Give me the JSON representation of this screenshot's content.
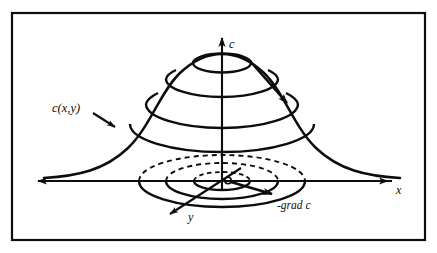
{
  "figure": {
    "title": "",
    "type": "3d-surface-diagram",
    "background_color": "#ffffff",
    "ink_color": "#0d0d0d",
    "frame": {
      "name": "figure-border",
      "x": 12,
      "y": 13,
      "width": 413,
      "height": 227,
      "stroke_width": 2.2
    },
    "axes": [
      {
        "id": "c",
        "label": "c",
        "orientation": "vertical-up",
        "label_x": 230,
        "label_y": 46
      },
      {
        "id": "x",
        "label": "x",
        "orientation": "horizontal-right",
        "label_x": 398,
        "label_y": 192
      },
      {
        "id": "y",
        "label": "y",
        "orientation": "oblique-down-left",
        "label_x": 190,
        "label_y": 219
      }
    ],
    "annotations": [
      {
        "id": "surface-label",
        "text": "c(x,y)",
        "x": 52,
        "y": 108,
        "style": "italic"
      },
      {
        "id": "gradient-label",
        "text": "-grad c",
        "x": 283,
        "y": 207,
        "style": "italic"
      }
    ],
    "surface": {
      "name": "bell-curve-silhouette",
      "peak_x": 222,
      "peak_y": 60,
      "baseline_y": 181,
      "contour_count": 3
    },
    "base_contours": {
      "name": "level-curve-ellipses",
      "count": 3,
      "center_x": 222,
      "center_y": 181,
      "radii_x": [
        28,
        56,
        83
      ],
      "radii_y": [
        9,
        18,
        26
      ],
      "front_style": "solid",
      "back_style": "dashed"
    },
    "gradient_arrow": {
      "name": "negative-gradient-vector",
      "from_x": 228,
      "from_y": 181,
      "to_x": 274,
      "to_y": 195,
      "marker_radius": 3.2
    },
    "surface_arrow": {
      "name": "steepest-descent-arrow",
      "from_x": 250,
      "from_y": 60,
      "to_x": 289,
      "to_y": 105
    }
  }
}
